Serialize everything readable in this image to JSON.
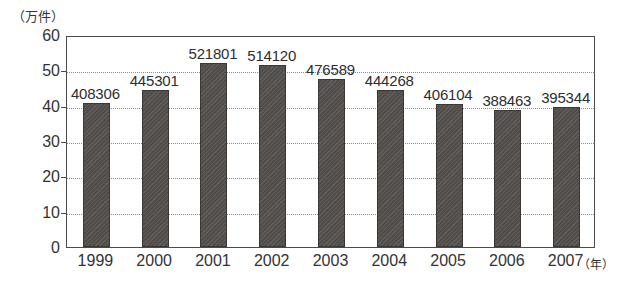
{
  "chart_data": {
    "type": "bar",
    "title": "",
    "subtitle": "",
    "xlabel": "（年）",
    "ylabel": "（万件）",
    "categories": [
      "1999",
      "2000",
      "2001",
      "2002",
      "2003",
      "2004",
      "2005",
      "2006",
      "2007"
    ],
    "values": [
      40.8306,
      44.5301,
      52.1801,
      51.412,
      47.6589,
      44.4268,
      40.6104,
      38.8463,
      39.5344
    ],
    "data_labels": [
      "408306",
      "445301",
      "521801",
      "514120",
      "476589",
      "444268",
      "406104",
      "388463",
      "395344"
    ],
    "ylim": [
      0,
      60
    ],
    "yticks": [
      0,
      10,
      20,
      30,
      40,
      50,
      60
    ],
    "ytick_labels": [
      "0",
      "10",
      "20",
      "30",
      "40",
      "50",
      "60"
    ],
    "grid": true,
    "grid_style": "dotted-horizontal",
    "legend": "none",
    "bar_color": "#55514f",
    "frame_color": "#4a4a4a",
    "background": "#ffffff",
    "value_unit_note": "Y axis is in 万件 (ten-thousand cases); data labels are raw counts in 件."
  },
  "axes": {
    "y_unit_caption": "（万件）",
    "x_unit_caption": "（年）"
  }
}
